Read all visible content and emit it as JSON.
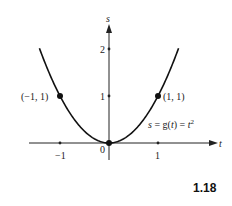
{
  "chart_data": {
    "type": "line",
    "title": "",
    "function": "s = g(t) = t^2",
    "xlabel": "t",
    "ylabel": "s",
    "xlim": [
      -1.65,
      2.1
    ],
    "ylim": [
      0,
      2.5
    ],
    "xticks": [
      -1,
      1
    ],
    "xtick_labels": [
      "−1",
      "1"
    ],
    "yticks": [
      1,
      2
    ],
    "ytick_labels": [
      "1",
      "2"
    ],
    "origin_label": "0",
    "grid": false,
    "series": [
      {
        "name": "s = g(t) = t²",
        "x": [
          -1.42,
          -1.2,
          -1.0,
          -0.8,
          -0.6,
          -0.4,
          -0.2,
          0,
          0.2,
          0.4,
          0.6,
          0.8,
          1.0,
          1.2,
          1.42
        ],
        "y": [
          2.02,
          1.44,
          1.0,
          0.64,
          0.36,
          0.16,
          0.04,
          0,
          0.04,
          0.16,
          0.36,
          0.64,
          1.0,
          1.44,
          2.02
        ]
      }
    ],
    "highlighted_points": [
      {
        "t": -1,
        "s": 1,
        "label": "(−1, 1)"
      },
      {
        "t": 0,
        "s": 0,
        "label": ""
      },
      {
        "t": 1,
        "s": 1,
        "label": "(1, 1)"
      }
    ],
    "annotations": [
      {
        "text": "s = g(t) = t²",
        "near": [
          1.2,
          0.5
        ]
      }
    ]
  },
  "labels": {
    "s_axis": "s",
    "t_axis": "t",
    "tick_neg1": "−1",
    "tick_1": "1",
    "tick_s1": "1",
    "tick_s2": "2",
    "origin": "0",
    "point_left": "(−1, 1)",
    "point_right": "(1, 1)",
    "equation_prefix": "s = g(",
    "equation_var": "t",
    "equation_mid": ") = ",
    "equation_base": "t",
    "equation_exp": "2"
  },
  "figure_number": "1.18"
}
